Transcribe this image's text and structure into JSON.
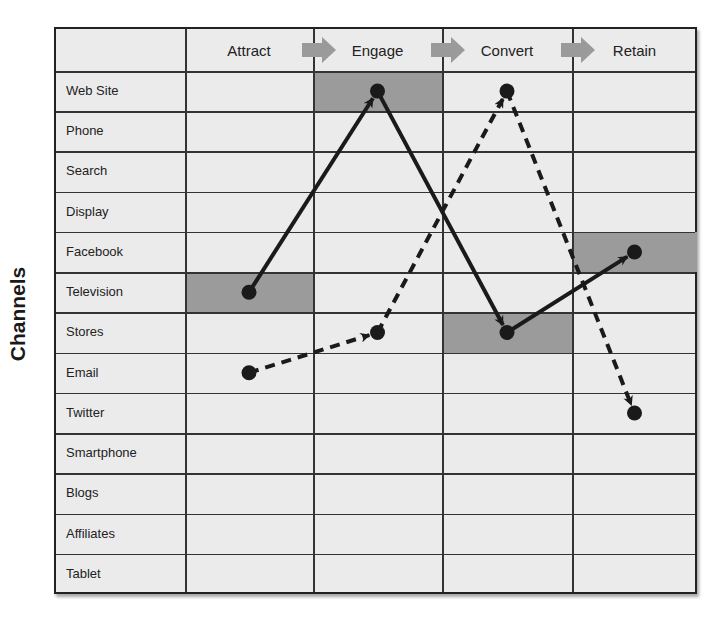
{
  "y_axis_label": "Channels",
  "stages": [
    {
      "label": "Attract",
      "x0": 185,
      "x1": 313
    },
    {
      "label": "Engage",
      "x0": 313,
      "x1": 442
    },
    {
      "label": "Convert",
      "x0": 442,
      "x1": 572
    },
    {
      "label": "Retain",
      "x0": 572,
      "x1": 697
    }
  ],
  "channels": [
    "Web Site",
    "Phone",
    "Search",
    "Display",
    "Facebook",
    "Television",
    "Stores",
    "Email",
    "Twitter",
    "Smartphone",
    "Blogs",
    "Affiliates",
    "Tablet"
  ],
  "colors": {
    "grid_fill": "#ebebeb",
    "highlight_cell": "#9b9b9b",
    "stage_arrow": "#9a9a9a",
    "path_line": "#1a1a1a"
  },
  "highlighted_cells": [
    {
      "stage": "Attract",
      "channel": "Television"
    },
    {
      "stage": "Engage",
      "channel": "Web Site"
    },
    {
      "stage": "Convert",
      "channel": "Stores"
    },
    {
      "stage": "Retain",
      "channel": "Facebook"
    }
  ],
  "paths": [
    {
      "name": "solid-journey",
      "style": "solid",
      "points": [
        {
          "stage": "Attract",
          "channel": "Television"
        },
        {
          "stage": "Engage",
          "channel": "Web Site"
        },
        {
          "stage": "Convert",
          "channel": "Stores"
        },
        {
          "stage": "Retain",
          "channel": "Facebook"
        }
      ]
    },
    {
      "name": "dashed-journey",
      "style": "dashed",
      "points": [
        {
          "stage": "Attract",
          "channel": "Email"
        },
        {
          "stage": "Engage",
          "channel": "Stores"
        },
        {
          "stage": "Convert",
          "channel": "Web Site"
        },
        {
          "stage": "Retain",
          "channel": "Twitter"
        }
      ]
    }
  ]
}
